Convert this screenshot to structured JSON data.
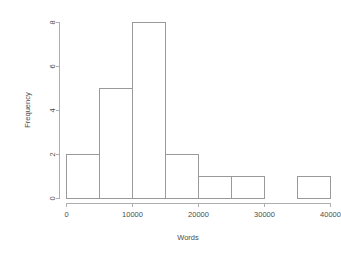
{
  "chart_data": {
    "type": "bar",
    "chart_subtype": "histogram",
    "title": "",
    "xlabel": "Words",
    "ylabel": "Frequency",
    "bin_width": 5000,
    "categories": [
      "0-5000",
      "5000-10000",
      "10000-15000",
      "15000-20000",
      "20000-25000",
      "25000-30000",
      "30000-35000",
      "35000-40000"
    ],
    "bin_edges": [
      0,
      5000,
      10000,
      15000,
      20000,
      25000,
      30000,
      35000,
      40000
    ],
    "values": [
      2,
      5,
      8,
      2,
      1,
      1,
      0,
      1
    ],
    "x": [
      0,
      5000,
      10000,
      15000,
      20000,
      25000,
      30000,
      35000
    ],
    "xlim": [
      0,
      40000
    ],
    "ylim": [
      0,
      8
    ],
    "xticks": [
      0,
      10000,
      20000,
      30000,
      40000
    ],
    "xtick_labels": [
      "0",
      "10000",
      "20000",
      "30000",
      "40000"
    ],
    "yticks": [
      0,
      2,
      4,
      6,
      8
    ],
    "ytick_labels": [
      "0",
      "2",
      "4",
      "6",
      "8"
    ],
    "grid": false,
    "legend": false,
    "legend_position": "none",
    "bar_fill_color": "#ffffff",
    "bar_border_color": "#9a9a9a",
    "axis_color": "#aeaeae",
    "text_color": "#4c4c4c",
    "background_color": "#ffffff"
  },
  "axes": {
    "x_title": "Words",
    "y_title": "Frequency"
  }
}
